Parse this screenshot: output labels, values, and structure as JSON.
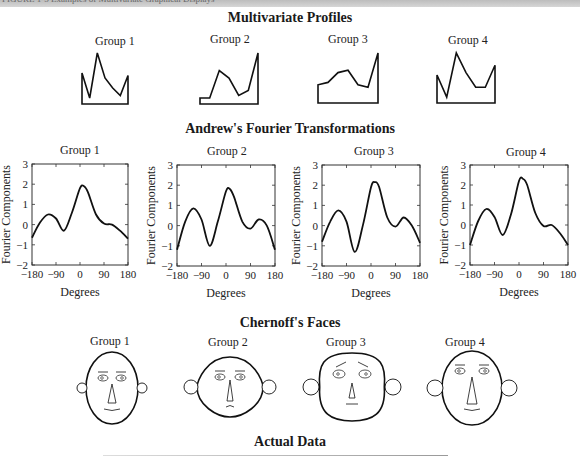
{
  "header": {
    "text": "FIGURE 1-5  Examples of Multivariate Graphical Displays"
  },
  "sections": {
    "profiles_title": "Multivariate Profiles",
    "fourier_title": "Andrew's Fourier Transformations",
    "faces_title": "Chernoff's Faces",
    "actual_title": "Actual Data"
  },
  "groups": [
    "Group 1",
    "Group 2",
    "Group 3",
    "Group 4"
  ],
  "axis": {
    "ylabel": "Fourier Components",
    "xlabel": "Degrees",
    "yticks": [
      "3",
      "2",
      "1",
      "0",
      "−1",
      "−2"
    ],
    "xticks": [
      "−180",
      "−90",
      "0",
      "90",
      "180"
    ]
  },
  "chart_data": [
    {
      "type": "line",
      "title": "Multivariate Profiles",
      "categories": [
        "v1",
        "v2",
        "v3",
        "v4",
        "v5",
        "v6",
        "v7"
      ],
      "series": [
        {
          "name": "Group 1",
          "values": [
            0.6,
            0.1,
            1.0,
            0.5,
            0.3,
            0.15,
            0.55
          ]
        },
        {
          "name": "Group 2",
          "values": [
            0.1,
            0.1,
            0.65,
            0.5,
            0.15,
            0.25,
            1.0
          ]
        },
        {
          "name": "Group 3",
          "values": [
            0.35,
            0.4,
            0.6,
            0.65,
            0.35,
            0.3,
            1.0
          ]
        },
        {
          "name": "Group 4",
          "values": [
            0.55,
            0.1,
            1.0,
            0.6,
            0.3,
            0.3,
            0.75
          ]
        }
      ]
    },
    {
      "type": "line",
      "title": "Andrew's Fourier Transformations",
      "xlabel": "Degrees",
      "ylabel": "Fourier Components",
      "xlim": [
        -180,
        180
      ],
      "ylim": [
        -2,
        3
      ],
      "x": [
        -180,
        -150,
        -120,
        -90,
        -60,
        -30,
        0,
        15,
        30,
        60,
        90,
        120,
        150,
        180
      ],
      "series": [
        {
          "name": "Group 1",
          "values": [
            -0.65,
            0.1,
            0.5,
            0.3,
            -0.3,
            0.6,
            1.8,
            1.9,
            1.6,
            0.5,
            0.05,
            0.0,
            -0.3,
            -0.7
          ]
        },
        {
          "name": "Group 2",
          "values": [
            -1.2,
            0.2,
            0.85,
            0.3,
            -1.0,
            0.2,
            1.7,
            1.8,
            1.4,
            0.2,
            -0.15,
            0.3,
            0.0,
            -1.2
          ]
        },
        {
          "name": "Group 3",
          "values": [
            -0.8,
            0.2,
            0.75,
            0.2,
            -1.3,
            0.0,
            1.9,
            2.15,
            1.9,
            0.4,
            -0.05,
            0.4,
            0.0,
            -0.85
          ]
        },
        {
          "name": "Group 4",
          "values": [
            -1.0,
            0.2,
            0.8,
            0.4,
            -0.5,
            0.5,
            2.2,
            2.3,
            2.0,
            0.6,
            -0.05,
            0.0,
            -0.4,
            -1.0
          ]
        }
      ]
    }
  ]
}
